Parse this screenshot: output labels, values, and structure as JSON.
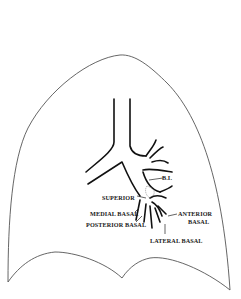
{
  "diagram": {
    "labels": {
      "bi": "B.I.",
      "superior": "SUPERIOR",
      "medial_basal": "MEDIAL BASAL",
      "anterior_basal_line1": "ANTERIOR",
      "anterior_basal_line2": "BASAL",
      "posterior_basal": "POSTERIOR BASAL",
      "lateral_basal": "LATERAL BASAL"
    },
    "colors": {
      "outline": "#444444",
      "bronchi": "#111111",
      "background": "#ffffff"
    }
  }
}
